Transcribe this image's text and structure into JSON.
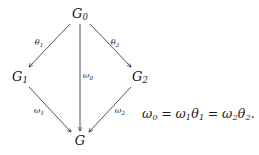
{
  "figure": {
    "type": "commutative-diagram",
    "background_color": "#ffffff",
    "ink_color": "#1a1a1a"
  },
  "nodes": [
    {
      "id": "G0",
      "base": "G",
      "sub": "0",
      "x": 80,
      "y": 14
    },
    {
      "id": "G1",
      "base": "G",
      "sub": "1",
      "x": 20,
      "y": 77
    },
    {
      "id": "G2",
      "base": "G",
      "sub": "2",
      "x": 140,
      "y": 77
    },
    {
      "id": "G",
      "base": "G",
      "sub": "",
      "x": 80,
      "y": 141
    }
  ],
  "edges": [
    {
      "id": "theta1",
      "from": "G0",
      "to": "G1",
      "label_base": "θ",
      "label_sub": "1",
      "label_x": 39,
      "label_y": 44,
      "x1": 70,
      "y1": 24,
      "x2": 29,
      "y2": 67
    },
    {
      "id": "theta2",
      "from": "G0",
      "to": "G2",
      "label_base": "θ",
      "label_sub": "2",
      "label_x": 115,
      "label_y": 44,
      "x1": 90,
      "y1": 24,
      "x2": 131,
      "y2": 67
    },
    {
      "id": "omega0",
      "from": "G0",
      "to": "G",
      "label_base": "ω",
      "label_sub": "0",
      "label_x": 88,
      "label_y": 77,
      "x1": 80,
      "y1": 24,
      "x2": 80,
      "y2": 131
    },
    {
      "id": "omega1",
      "from": "G1",
      "to": "G",
      "label_base": "ω",
      "label_sub": "1",
      "label_x": 39,
      "label_y": 112,
      "x1": 29,
      "y1": 87,
      "x2": 71,
      "y2": 132
    },
    {
      "id": "omega2",
      "from": "G2",
      "to": "G",
      "label_base": "ω",
      "label_sub": "2",
      "label_x": 120,
      "label_y": 112,
      "x1": 131,
      "y1": 87,
      "x2": 89,
      "y2": 132
    }
  ],
  "equation": {
    "x": 142,
    "y": 115,
    "text": "ω₀ = ω₁θ₁ = ω₂θ₂.",
    "parts": {
      "lhs_base": "ω",
      "lhs_sub": "0",
      "eq1": "=",
      "mid_omega": "ω",
      "mid_omega_sub": "1",
      "mid_theta": "θ",
      "mid_theta_sub": "1",
      "eq2": "=",
      "rhs_omega": "ω",
      "rhs_omega_sub": "2",
      "rhs_theta": "θ",
      "rhs_theta_sub": "2",
      "period": "."
    }
  }
}
